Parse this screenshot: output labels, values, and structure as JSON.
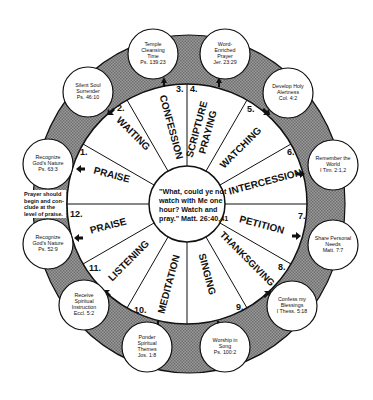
{
  "diagram": {
    "hub_quote": {
      "line1": "\"What, could ye not",
      "line2": "watch with Me one",
      "line3": "hour? Watch and",
      "line4": "pray.\" Matt. 26:40,41"
    },
    "side_note": {
      "line1": "Prayer should",
      "line2": "begin and con-",
      "line3": "clude at the",
      "line4": "level of praise."
    },
    "segments": [
      {
        "number": "1.",
        "label": "PRAISE"
      },
      {
        "number": "2.",
        "label": "WAITING"
      },
      {
        "number": "3.",
        "label": "CONFESSION"
      },
      {
        "number": "4.",
        "label_line1": "SCRIPTURE",
        "label_line2": "PRAYING"
      },
      {
        "number": "5.",
        "label": "WATCHING"
      },
      {
        "number": "6.",
        "label": "INTERCESSION"
      },
      {
        "number": "7.",
        "label": "PETITION"
      },
      {
        "number": "8.",
        "label": "THANKSGIVING"
      },
      {
        "number": "9.",
        "label": "SINGING"
      },
      {
        "number": "10.",
        "label": "MEDITATION"
      },
      {
        "number": "11.",
        "label": "LISTENING"
      },
      {
        "number": "12.",
        "label": "PRAISE"
      }
    ],
    "outer_circles": [
      {
        "line1": "Recognize",
        "line2": "God's Nature",
        "line3": "Ps. 63:3"
      },
      {
        "line1": "Silent Soul",
        "line2": "Surrender",
        "line3": "Ps. 46:10"
      },
      {
        "line1": "Temple",
        "line2": "Cleansing",
        "line3": "Time",
        "line4": "Ps. 139:23"
      },
      {
        "line1": "Word-",
        "line2": "Enriched",
        "line3": "Prayer",
        "line4": "Jer. 23:29"
      },
      {
        "line1": "Develop Holy",
        "line2": "Alertness",
        "line3": "Col. 4:2"
      },
      {
        "line1": "Remember the",
        "line2": "World",
        "line3": "I Tim. 2:1,2"
      },
      {
        "line1": "Share Personal",
        "line2": "Needs",
        "line3": "Matt. 7:7"
      },
      {
        "line1": "Confess my",
        "line2": "Blessings",
        "line3": "I Thess. 5:18"
      },
      {
        "line1": "Worship in",
        "line2": "Song",
        "line3": "Ps. 100:2"
      },
      {
        "line1": "Ponder",
        "line2": "Spiritual",
        "line3": "Themes",
        "line4": "Jos. 1:8"
      },
      {
        "line1": "Receive",
        "line2": "Spiritual",
        "line3": "Instruction",
        "line4": "Eccl. 5:2"
      },
      {
        "line1": "Recognize",
        "line2": "God's Nature",
        "line3": "Ps. 52:9"
      }
    ],
    "colors": {
      "ring_fill": "#8a8a8a",
      "line": "#111111",
      "background": "#ffffff"
    }
  }
}
